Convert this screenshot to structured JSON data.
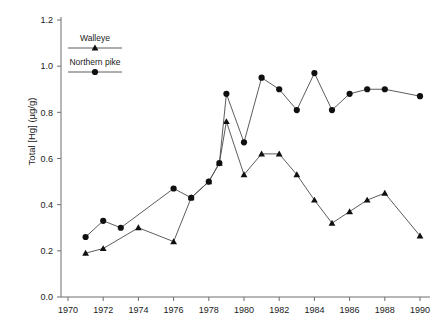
{
  "chart_data": {
    "type": "line",
    "title": "",
    "xlabel": "",
    "ylabel": "Total [Hg] (µg/g)",
    "xlim": [
      1970,
      1990
    ],
    "ylim": [
      0.0,
      1.2
    ],
    "grid": false,
    "legend_position": "top-left-inside",
    "x_ticks": [
      1970,
      1972,
      1974,
      1976,
      1978,
      1980,
      1982,
      1984,
      1986,
      1988,
      1990
    ],
    "x_tick_labels": [
      "1970",
      "1972",
      "1974",
      "1976",
      "1978",
      "1980",
      "1982",
      "1984",
      "1986",
      "1988",
      "1990"
    ],
    "y_ticks": [
      0.0,
      0.2,
      0.4,
      0.6,
      0.8,
      1.0,
      1.2
    ],
    "y_tick_labels": [
      "0.0",
      "0.2",
      "0.4",
      "0.6",
      "0.8",
      "1.0",
      "1.2"
    ],
    "series": [
      {
        "name": "Walleye",
        "marker": "triangle",
        "x": [
          1971,
          1972,
          1974,
          1976,
          1977,
          1978,
          1978.6,
          1979,
          1980,
          1981,
          1982,
          1983,
          1984,
          1985,
          1986,
          1987,
          1988,
          1990
        ],
        "values": [
          0.19,
          0.21,
          0.3,
          0.24,
          0.43,
          0.5,
          0.58,
          0.76,
          0.53,
          0.62,
          0.62,
          0.53,
          0.42,
          0.32,
          0.37,
          0.42,
          0.45,
          0.265
        ]
      },
      {
        "name": "Northern pike",
        "marker": "circle",
        "x": [
          1971,
          1972,
          1973,
          1976,
          1977,
          1978,
          1978.6,
          1979,
          1980,
          1981,
          1982,
          1983,
          1984,
          1985,
          1986,
          1987,
          1988,
          1990
        ],
        "values": [
          0.26,
          0.33,
          0.3,
          0.47,
          0.43,
          0.5,
          0.58,
          0.88,
          0.67,
          0.95,
          0.9,
          0.81,
          0.97,
          0.81,
          0.88,
          0.9,
          0.9,
          0.87
        ]
      }
    ]
  },
  "legend": {
    "walleye_label": "Walleye",
    "pike_label": "Northern pike"
  }
}
